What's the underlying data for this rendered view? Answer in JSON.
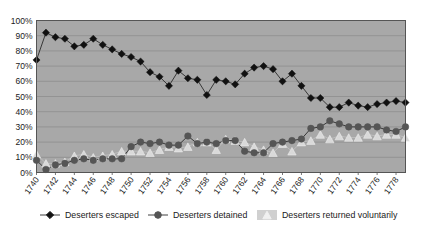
{
  "chart_data": {
    "type": "line",
    "title": "",
    "subtitle": "",
    "xlabel": "",
    "ylabel": "",
    "grid": true,
    "legend_position": "bottom",
    "ylim": [
      0,
      100
    ],
    "ytick_labels": [
      "0%",
      "10%",
      "20%",
      "30%",
      "40%",
      "50%",
      "60%",
      "70%",
      "80%",
      "90%",
      "100%"
    ],
    "ytick_values": [
      0,
      10,
      20,
      30,
      40,
      50,
      60,
      70,
      80,
      90,
      100
    ],
    "x": [
      1740,
      1741,
      1742,
      1743,
      1744,
      1745,
      1746,
      1747,
      1748,
      1749,
      1750,
      1751,
      1752,
      1753,
      1754,
      1755,
      1756,
      1757,
      1758,
      1759,
      1760,
      1761,
      1762,
      1763,
      1764,
      1765,
      1766,
      1767,
      1768,
      1769,
      1770,
      1771,
      1772,
      1773,
      1774,
      1775,
      1776,
      1777,
      1778,
      1779
    ],
    "xtick_labels": [
      "1740",
      "1742",
      "1744",
      "1746",
      "1748",
      "1750",
      "1752",
      "1754",
      "1756",
      "1758",
      "1760",
      "1762",
      "1764",
      "1766",
      "1768",
      "1770",
      "1772",
      "1774",
      "1776",
      "1778"
    ],
    "xtick_values": [
      1740,
      1742,
      1744,
      1746,
      1748,
      1750,
      1752,
      1754,
      1756,
      1758,
      1760,
      1762,
      1764,
      1766,
      1768,
      1770,
      1772,
      1774,
      1776,
      1778
    ],
    "series": [
      {
        "name": "Deserters escaped",
        "marker": "diamond",
        "color": "#111111",
        "values": [
          74,
          92,
          89,
          88,
          83,
          84,
          88,
          84,
          81,
          78,
          76,
          73,
          66,
          63,
          57,
          67,
          62,
          61,
          51,
          61,
          60,
          58,
          65,
          69,
          70,
          68,
          60,
          65,
          57,
          49,
          49,
          43,
          43,
          46,
          44,
          43,
          45,
          46,
          47,
          46
        ]
      },
      {
        "name": "Deserters detained",
        "marker": "circle",
        "color": "#555555",
        "values": [
          8,
          2,
          5,
          6,
          8,
          9,
          8,
          9,
          9,
          9,
          17,
          20,
          19,
          20,
          18,
          18,
          24,
          19,
          20,
          19,
          21,
          21,
          14,
          13,
          13,
          19,
          20,
          21,
          22,
          29,
          30,
          34,
          32,
          30,
          30,
          30,
          30,
          28,
          27,
          30
        ]
      },
      {
        "name": "Deserters returned voluntarily",
        "marker": "triangle",
        "color": "#d9d9d9",
        "values": [
          12,
          6,
          6,
          7,
          11,
          12,
          10,
          11,
          12,
          14,
          14,
          14,
          13,
          15,
          17,
          16,
          17,
          20,
          20,
          15,
          22,
          21,
          20,
          17,
          15,
          13,
          19,
          14,
          20,
          21,
          25,
          22,
          24,
          23,
          23,
          25,
          24,
          25,
          25,
          23
        ]
      }
    ]
  },
  "plot_style": {
    "plot_background": "#a8a8a8",
    "grid_color": "#8e8e8e",
    "axis_color": "#555555",
    "page_background": "#ffffff",
    "text_color": "#1a1a1a"
  },
  "legend": {
    "items": [
      {
        "label": "Deserters escaped",
        "marker": "diamond-marker-icon"
      },
      {
        "label": "Deserters detained",
        "marker": "circle-marker-icon"
      },
      {
        "label": "Deserters returned voluntarily",
        "marker": "triangle-swatch-icon"
      }
    ]
  }
}
